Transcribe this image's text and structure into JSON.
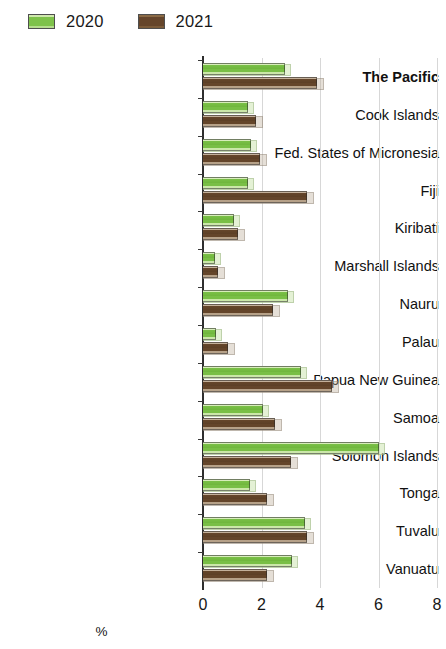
{
  "legend": {
    "position": "top-left",
    "items": [
      {
        "label": "2020",
        "color": "#7ec24a",
        "icon": "legend-swatch-2020"
      },
      {
        "label": "2021",
        "color": "#65452b",
        "icon": "legend-swatch-2021"
      }
    ]
  },
  "axis": {
    "x_title": "%",
    "x_ticks": [
      "0",
      "2",
      "4",
      "6",
      "8"
    ],
    "x_min": 0,
    "x_max": 8
  },
  "chart_data": {
    "type": "bar",
    "orientation": "horizontal",
    "title": "",
    "subtitle": "",
    "xlabel": "%",
    "ylabel": "",
    "xlim": [
      0,
      8
    ],
    "xticks": [
      0,
      2,
      4,
      6,
      8
    ],
    "grid": "vertical",
    "legend_position": "top-left",
    "categories": [
      "The Pacific",
      "Cook Islands",
      "Fed. States of Micronesia",
      "Fiji",
      "Kiribati",
      "Marshall Islands",
      "Nauru",
      "Palau",
      "Papua New Guinea",
      "Samoa",
      "Solomon Islands",
      "Tonga",
      "Tuvalu",
      "Vanuatu"
    ],
    "emphasized_category": "The Pacific",
    "series": [
      {
        "name": "2020",
        "color": "#7ec24a",
        "values": [
          2.8,
          1.55,
          1.65,
          1.55,
          1.05,
          0.4,
          2.9,
          0.45,
          3.35,
          2.05,
          6.0,
          1.6,
          3.5,
          3.05
        ]
      },
      {
        "name": "2021",
        "color": "#65452b",
        "values": [
          3.9,
          1.8,
          1.95,
          3.55,
          1.2,
          0.5,
          2.4,
          0.85,
          4.4,
          2.45,
          3.0,
          2.2,
          3.55,
          2.2
        ]
      }
    ]
  }
}
